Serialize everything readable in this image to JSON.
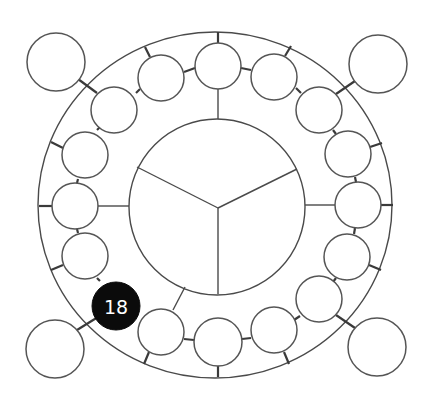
{
  "diagram": {
    "type": "circular-node-diagram",
    "colors": {
      "line": "#4a4a4a",
      "node_fill": "#ffffff",
      "highlight_fill": "#0b0b0b",
      "highlight_text": "#ffffff"
    },
    "outer_ring": {
      "cx": 215,
      "cy": 205,
      "rx": 177,
      "ry": 173
    },
    "inner_circle": {
      "cx": 217,
      "cy": 207,
      "r": 88,
      "divider_center": [
        218,
        208
      ],
      "divider_ends": [
        [
          137,
          167
        ],
        [
          297,
          169
        ],
        [
          218,
          293
        ]
      ]
    },
    "highlighted_node": {
      "label": "18",
      "index": 10
    },
    "ring_nodes": [
      {
        "cx": 218,
        "cy": 66
      },
      {
        "cx": 274,
        "cy": 77
      },
      {
        "cx": 319,
        "cy": 110
      },
      {
        "cx": 348,
        "cy": 154
      },
      {
        "cx": 358,
        "cy": 205
      },
      {
        "cx": 347,
        "cy": 257
      },
      {
        "cx": 319,
        "cy": 299
      },
      {
        "cx": 274,
        "cy": 330
      },
      {
        "cx": 218,
        "cy": 342
      },
      {
        "cx": 161,
        "cy": 332
      },
      {
        "cx": 116,
        "cy": 306
      },
      {
        "cx": 85,
        "cy": 256
      },
      {
        "cx": 75,
        "cy": 206
      },
      {
        "cx": 85,
        "cy": 155
      },
      {
        "cx": 114,
        "cy": 110
      },
      {
        "cx": 161,
        "cy": 78
      }
    ],
    "corner_nodes": [
      {
        "name": "top-left",
        "cx": 56,
        "cy": 62,
        "r": 29
      },
      {
        "name": "top-right",
        "cx": 378,
        "cy": 64,
        "r": 29
      },
      {
        "name": "bottom-right",
        "cx": 377,
        "cy": 347,
        "r": 29
      },
      {
        "name": "bottom-left",
        "cx": 55,
        "cy": 349,
        "r": 29
      }
    ]
  }
}
